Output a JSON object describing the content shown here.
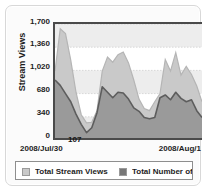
{
  "chart_data": {
    "type": "area",
    "title": "",
    "xlabel": "",
    "ylabel": "Stream Views",
    "ylim": [
      0,
      1700
    ],
    "grid": true,
    "grid_banding": true,
    "legend_position": "bottom",
    "y_ticks": [
      "1,700",
      "1,360",
      "1,020",
      "680",
      "340",
      "0"
    ],
    "y_tick_values": [
      1700,
      1360,
      1020,
      680,
      340,
      0
    ],
    "x_tick_labels": [
      "2008/Jul/30",
      "2008/Aug/1"
    ],
    "annotations": [
      {
        "label": "107",
        "value": 107
      }
    ],
    "series": [
      {
        "name": "Total Stream Views",
        "color": "#c9c9c9",
        "style": "area",
        "values": [
          1010,
          1630,
          1560,
          1170,
          700,
          370,
          250,
          260,
          430,
          1010,
          1215,
          1140,
          1250,
          1290,
          1130,
          880,
          600,
          460,
          430,
          560,
          680,
          1180,
          1010,
          1280,
          950,
          1080,
          960,
          790,
          560
        ]
      },
      {
        "name": "Total Number of",
        "color": "#8f8f8f",
        "style": "area-line",
        "values": [
          880,
          800,
          680,
          560,
          380,
          230,
          107,
          180,
          400,
          780,
          700,
          620,
          700,
          690,
          600,
          470,
          420,
          330,
          310,
          330,
          620,
          660,
          590,
          700,
          610,
          560,
          590,
          430,
          330
        ]
      }
    ]
  },
  "legend": {
    "items": [
      {
        "label": "Total Stream Views",
        "swatch": "#c9c9c9"
      },
      {
        "label": "Total Number of",
        "swatch": "#777777"
      }
    ]
  },
  "colors": {
    "card_bg": "#fbfbfb",
    "card_border": "#d8d8d8",
    "plot_bg": "#ffffff",
    "axis": "#4a4a4a",
    "band": "#ededed",
    "gridline": "#cfcfcf",
    "series_light": "#c9c9c9",
    "series_dark": "#9a9a9a",
    "series_dark_line": "#5d5d5d",
    "text": "#1d1d1d"
  }
}
